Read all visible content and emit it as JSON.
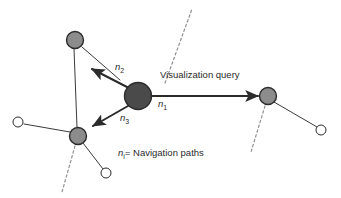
{
  "figure": {
    "type": "node-link-diagram",
    "background_color": "#ffffff",
    "width": 341,
    "height": 198
  },
  "colors": {
    "focus_node_fill": "#4a4a4a",
    "gray_node_fill": "#8c8c8c",
    "white_node_fill": "#ffffff",
    "stroke": "#2b2b2b",
    "thin_stroke": "#3a3a3a",
    "dashed_stroke": "#8f8f8f",
    "text": "#2b2b2b"
  },
  "labels": {
    "query": "Visualization query",
    "path_1": "n",
    "path_1_sub": "1",
    "path_2": "n",
    "path_2_sub": "2",
    "path_3": "n",
    "path_3_sub": "3",
    "legend_symbol": "n",
    "legend_symbol_sub": "i",
    "legend_text": "= Navigation paths"
  },
  "nodes": [
    {
      "id": "focus",
      "name": "focus-node",
      "kind": "focus",
      "cx": 138,
      "cy": 96,
      "r": 13.5
    },
    {
      "id": "gray-top",
      "name": "gray-node-top-left",
      "kind": "gray",
      "cx": 75,
      "cy": 40,
      "r": 8.5
    },
    {
      "id": "gray-bottom",
      "name": "gray-node-bottom-left",
      "kind": "gray",
      "cx": 78,
      "cy": 136,
      "r": 8.5
    },
    {
      "id": "gray-right",
      "name": "gray-node-right",
      "kind": "gray",
      "cx": 268,
      "cy": 96,
      "r": 8.5
    },
    {
      "id": "white-left",
      "name": "white-node-left",
      "kind": "white",
      "cx": 18,
      "cy": 122,
      "r": 5.0
    },
    {
      "id": "white-bottom",
      "name": "white-node-bottom",
      "kind": "white",
      "cx": 106,
      "cy": 173,
      "r": 5.0
    },
    {
      "id": "white-right",
      "name": "white-node-right",
      "kind": "white",
      "cx": 321,
      "cy": 130,
      "r": 5.0
    }
  ],
  "edges": {
    "arrows": [
      {
        "name": "edge-n1-focus-to-right",
        "label": "n1",
        "x1": 152,
        "y1": 96,
        "x2": 258,
        "y2": 96
      },
      {
        "name": "edge-n2-focus-to-top",
        "label": "n2",
        "x1": 127,
        "y1": 87,
        "x2": 92,
        "y2": 69
      },
      {
        "name": "edge-n3-focus-to-bottom",
        "label": "n3",
        "x1": 128,
        "y1": 106,
        "x2": 93,
        "y2": 126
      }
    ],
    "plain": [
      {
        "name": "edge-top-gray-to-n2-line",
        "x1": 82,
        "y1": 47,
        "x2": 120,
        "y2": 80
      },
      {
        "name": "edge-top-gray-to-bottom-gray",
        "x1": 74,
        "y1": 49,
        "x2": 77,
        "y2": 127
      },
      {
        "name": "edge-bottom-gray-to-white-left",
        "x1": 70,
        "y1": 132,
        "x2": 24,
        "y2": 124
      },
      {
        "name": "edge-bottom-gray-to-white-bottom",
        "x1": 83,
        "y1": 143,
        "x2": 103,
        "y2": 169
      },
      {
        "name": "edge-right-gray-to-white-right",
        "x1": 274,
        "y1": 102,
        "x2": 317,
        "y2": 127
      }
    ],
    "dashed": [
      {
        "name": "dashed-boundary-center",
        "x1": 165,
        "y1": 83,
        "x2": 192,
        "y2": 9
      },
      {
        "name": "dashed-boundary-left",
        "x1": 75,
        "y1": 146,
        "x2": 62,
        "y2": 192
      },
      {
        "name": "dashed-boundary-right",
        "x1": 265,
        "y1": 106,
        "x2": 251,
        "y2": 152
      }
    ]
  },
  "text_positions": {
    "query": {
      "x": 160,
      "y": 70
    },
    "n1": {
      "x": 158,
      "y": 99
    },
    "n2": {
      "x": 115,
      "y": 62
    },
    "n3": {
      "x": 120,
      "y": 113
    },
    "legend": {
      "x": 118,
      "y": 148
    }
  }
}
